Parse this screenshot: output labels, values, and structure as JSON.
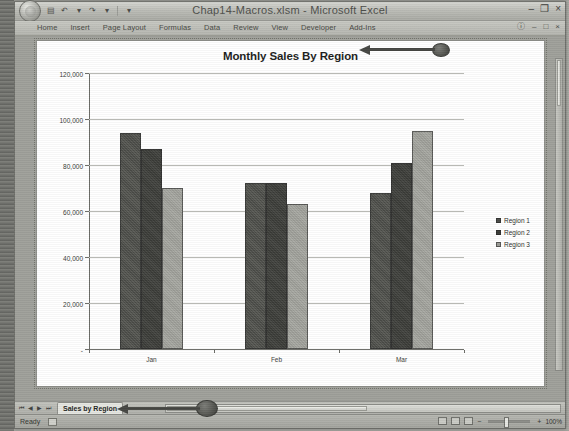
{
  "window": {
    "title": "Chap14-Macros.xlsm  -  Microsoft Excel",
    "controls": {
      "minimize": "–",
      "restore": "❐",
      "close": "×"
    },
    "quick_access": [
      {
        "name": "save-icon",
        "glyph": "▤"
      },
      {
        "name": "undo-icon",
        "glyph": "↶"
      },
      {
        "name": "undo-dropdown-icon",
        "glyph": "▾"
      },
      {
        "name": "redo-icon",
        "glyph": "↷"
      },
      {
        "name": "redo-dropdown-icon",
        "glyph": "▾"
      },
      {
        "name": "customize-qat-icon",
        "glyph": "▾"
      }
    ]
  },
  "ribbon": {
    "tabs": [
      {
        "label": "Home",
        "active": false
      },
      {
        "label": "Insert",
        "active": false
      },
      {
        "label": "Page Layout",
        "active": false
      },
      {
        "label": "Formulas",
        "active": false
      },
      {
        "label": "Data",
        "active": false
      },
      {
        "label": "Review",
        "active": false
      },
      {
        "label": "View",
        "active": false
      },
      {
        "label": "Developer",
        "active": false
      },
      {
        "label": "Add-Ins",
        "active": false
      }
    ],
    "right_controls": [
      {
        "name": "help-icon",
        "glyph": "ⓘ"
      },
      {
        "name": "minimize-workbook-icon",
        "glyph": "–"
      },
      {
        "name": "restore-workbook-icon",
        "glyph": "□"
      },
      {
        "name": "close-workbook-icon",
        "glyph": "×"
      }
    ]
  },
  "chart_data": {
    "type": "bar",
    "title": "Monthly Sales By Region",
    "xlabel": "",
    "ylabel": "",
    "categories": [
      "Jan",
      "Feb",
      "Mar"
    ],
    "series": [
      {
        "name": "Region 1",
        "values": [
          94000,
          72000,
          68000
        ],
        "color": "#4a4b47"
      },
      {
        "name": "Region 2",
        "values": [
          87000,
          72000,
          81000
        ],
        "color": "#3a3b37"
      },
      {
        "name": "Region 3",
        "values": [
          70000,
          63000,
          95000
        ],
        "color": "#9b9c96"
      }
    ],
    "ylim": [
      0,
      120000
    ],
    "ytick_values": [
      0,
      20000,
      40000,
      60000,
      80000,
      100000,
      120000
    ],
    "ytick_labels": [
      "-",
      "20,000",
      "40,000",
      "60,000",
      "80,000",
      "100,000",
      "120,000"
    ],
    "grid": true,
    "legend_position": "right"
  },
  "annotations": [
    {
      "name": "title-callout",
      "target": "chart-title"
    },
    {
      "name": "sheet-tab-callout",
      "target": "sheet-tab"
    }
  ],
  "sheet_bar": {
    "nav": [
      {
        "name": "first-sheet-icon",
        "glyph": "⏮"
      },
      {
        "name": "prev-sheet-icon",
        "glyph": "◀"
      },
      {
        "name": "next-sheet-icon",
        "glyph": "▶"
      },
      {
        "name": "last-sheet-icon",
        "glyph": "⏭"
      }
    ],
    "active_tab": "Sales by Region"
  },
  "status_bar": {
    "status": "Ready",
    "zoom_percent": "100%",
    "zoom_out": "−",
    "zoom_in": "+"
  }
}
